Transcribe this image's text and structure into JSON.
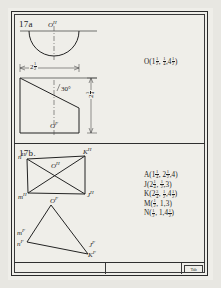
{
  "sheet": {
    "title_block": {
      "stamp_text": "Tab"
    }
  },
  "panel_a": {
    "label": "17a",
    "top_view_point": {
      "base": "O",
      "sup": "H"
    },
    "front_view_point": {
      "base": "O",
      "sup": "F"
    },
    "width_dimension": {
      "whole": "2",
      "num": "1",
      "den": "2"
    },
    "height_dimension": {
      "whole": "2",
      "num": "3",
      "den": "4"
    },
    "angle_label": "30°",
    "coordinate": {
      "name": "O",
      "x": {
        "whole": "1",
        "num": "1",
        "den": "2"
      },
      "y": {
        "whole": "",
        "num": "1",
        "den": "4"
      },
      "z": {
        "whole": "4",
        "num": "1",
        "den": "2"
      }
    }
  },
  "panel_b": {
    "label": "17b.",
    "top_view_points": [
      {
        "base": "n",
        "sup": "H"
      },
      {
        "base": "K",
        "sup": "H"
      },
      {
        "base": "O",
        "sup": "H"
      },
      {
        "base": "m",
        "sup": "H"
      },
      {
        "base": "J",
        "sup": "H"
      }
    ],
    "front_view_points": [
      {
        "base": "O",
        "sup": "F"
      },
      {
        "base": "m",
        "sup": "F"
      },
      {
        "base": "n",
        "sup": "F"
      },
      {
        "base": "J",
        "sup": "F"
      },
      {
        "base": "K",
        "sup": "F"
      }
    ],
    "coordinates": [
      {
        "name": "A",
        "x": {
          "whole": "1",
          "num": "1",
          "den": "4"
        },
        "y": {
          "whole": "2",
          "num": "1",
          "den": "2"
        },
        "z": {
          "whole": "4",
          "num": "",
          "den": ""
        }
      },
      {
        "name": "J",
        "x": {
          "whole": "2",
          "num": "1",
          "den": "4"
        },
        "y": {
          "whole": "",
          "num": "1",
          "den": "2"
        },
        "z": {
          "whole": "3",
          "num": "",
          "den": ""
        }
      },
      {
        "name": "K",
        "x": {
          "whole": "2",
          "num": "3",
          "den": "4"
        },
        "y": {
          "whole": "",
          "num": "1",
          "den": "2"
        },
        "z": {
          "whole": "4",
          "num": "1",
          "den": "2"
        }
      },
      {
        "name": "M",
        "x": {
          "whole": "",
          "num": "1",
          "den": "2"
        },
        "y": {
          "whole": "1",
          "num": "",
          "den": ""
        },
        "z": {
          "whole": "3",
          "num": "",
          "den": ""
        }
      },
      {
        "name": "N",
        "x": {
          "whole": "",
          "num": "1",
          "den": "2"
        },
        "y": {
          "whole": "1",
          "num": "",
          "den": ""
        },
        "z": {
          "whole": "4",
          "num": "1",
          "den": "2"
        }
      }
    ]
  }
}
